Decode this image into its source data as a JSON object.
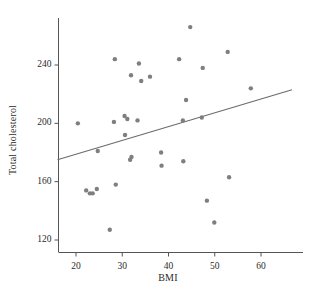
{
  "chart_data": {
    "type": "scatter",
    "title": "",
    "xlabel": "BMI",
    "ylabel": "Total cholesterol",
    "xlim": [
      16,
      66
    ],
    "ylim": [
      112,
      272
    ],
    "xticks": [
      20,
      30,
      40,
      50,
      60
    ],
    "yticks": [
      120,
      160,
      200,
      240
    ],
    "grid": false,
    "legend": "none",
    "marker": {
      "color": "#7f7f7f",
      "shape": "circle",
      "size_px": 4.4
    },
    "trendline": {
      "type": "linear-fit",
      "color": "#6b6b6b",
      "width_px": 1.1,
      "x_start": 16.0,
      "y_start": 175.0,
      "x_end": 66.7,
      "y_end": 223.0
    },
    "points": [
      {
        "x": 20.4,
        "y": 200
      },
      {
        "x": 22.2,
        "y": 154
      },
      {
        "x": 23.0,
        "y": 152
      },
      {
        "x": 23.6,
        "y": 152
      },
      {
        "x": 24.5,
        "y": 155
      },
      {
        "x": 24.7,
        "y": 181
      },
      {
        "x": 27.3,
        "y": 127
      },
      {
        "x": 28.2,
        "y": 201
      },
      {
        "x": 28.4,
        "y": 244
      },
      {
        "x": 28.6,
        "y": 158
      },
      {
        "x": 30.5,
        "y": 205
      },
      {
        "x": 30.6,
        "y": 192
      },
      {
        "x": 31.1,
        "y": 203
      },
      {
        "x": 31.7,
        "y": 175
      },
      {
        "x": 31.9,
        "y": 233
      },
      {
        "x": 32.0,
        "y": 177
      },
      {
        "x": 33.3,
        "y": 202
      },
      {
        "x": 33.6,
        "y": 241
      },
      {
        "x": 34.1,
        "y": 229
      },
      {
        "x": 36.0,
        "y": 232
      },
      {
        "x": 38.4,
        "y": 180
      },
      {
        "x": 38.5,
        "y": 171
      },
      {
        "x": 42.3,
        "y": 244
      },
      {
        "x": 43.1,
        "y": 202
      },
      {
        "x": 43.2,
        "y": 174
      },
      {
        "x": 43.8,
        "y": 216
      },
      {
        "x": 44.7,
        "y": 266
      },
      {
        "x": 47.2,
        "y": 204
      },
      {
        "x": 47.4,
        "y": 238
      },
      {
        "x": 48.3,
        "y": 147
      },
      {
        "x": 49.9,
        "y": 132
      },
      {
        "x": 52.8,
        "y": 249
      },
      {
        "x": 53.1,
        "y": 163
      },
      {
        "x": 57.8,
        "y": 224
      }
    ]
  },
  "axes": {
    "x_tick_labels": [
      "20",
      "30",
      "40",
      "50",
      "60"
    ],
    "y_tick_labels": [
      "240",
      "200",
      "160",
      "120"
    ],
    "x_axis_label": "BMI",
    "y_axis_label": "Total cholesterol",
    "axis_color": "#555555"
  }
}
